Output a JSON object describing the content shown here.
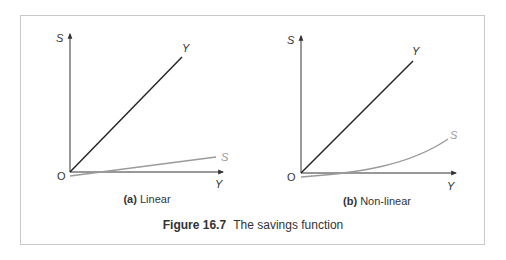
{
  "figure": {
    "number": "Figure 16.7",
    "title": "The savings function"
  },
  "panels": [
    {
      "tag": "(a)",
      "label": "Linear",
      "y_axis_label": "S",
      "x_axis_label": "Y",
      "origin_label": "O",
      "line_45_label": "Y",
      "savings_label": "S"
    },
    {
      "tag": "(b)",
      "label": "Non-linear",
      "y_axis_label": "S",
      "x_axis_label": "Y",
      "origin_label": "O",
      "line_45_label": "Y",
      "savings_label": "S"
    }
  ],
  "colors": {
    "axis": "#333333",
    "line_45": "#222222",
    "savings_line": "#9a9a9a",
    "frame": "#c8c8c8"
  }
}
